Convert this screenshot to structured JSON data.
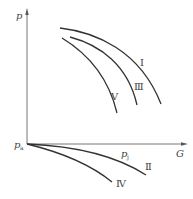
{
  "diagram": {
    "type": "pressure-flow characteristic curves",
    "axes": {
      "y_label": "p",
      "x_label": "G",
      "origin_label": "p",
      "origin_subscript": "a",
      "x_marker_label": "p",
      "x_marker_subscript": "j"
    },
    "curves": [
      {
        "id": "I",
        "label": "I",
        "region": "above-axis"
      },
      {
        "id": "III",
        "label": "Ⅲ",
        "region": "above-axis"
      },
      {
        "id": "V",
        "label": "V",
        "region": "above-axis"
      },
      {
        "id": "II",
        "label": "Ⅱ",
        "region": "below-axis"
      },
      {
        "id": "IV",
        "label": "Ⅳ",
        "region": "below-axis"
      }
    ],
    "colors": {
      "curve": "#333333",
      "axis": "#666666",
      "text": "#444444",
      "background": "#ffffff"
    }
  }
}
